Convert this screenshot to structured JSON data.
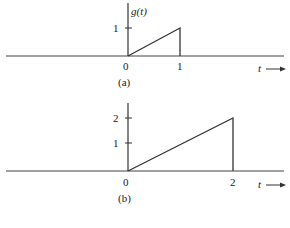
{
  "figure": {
    "panel_a": {
      "caption": "(a)",
      "ylabel": "g(t)",
      "xlabel": "t",
      "xticks": [
        "0",
        "1"
      ],
      "yticks": [
        "1"
      ],
      "signal": {
        "type": "ramp",
        "points": [
          [
            0,
            0
          ],
          [
            1,
            1
          ],
          [
            1,
            0
          ]
        ]
      }
    },
    "panel_b": {
      "caption": "(b)",
      "xlabel": "t",
      "xticks": [
        "0",
        "2"
      ],
      "yticks": [
        "1",
        "2"
      ],
      "signal": {
        "type": "ramp",
        "points": [
          [
            0,
            0
          ],
          [
            2,
            2
          ],
          [
            2,
            0
          ]
        ]
      }
    },
    "colors": {
      "line": "#333333",
      "text": "#222222",
      "background": "#ffffff"
    }
  }
}
